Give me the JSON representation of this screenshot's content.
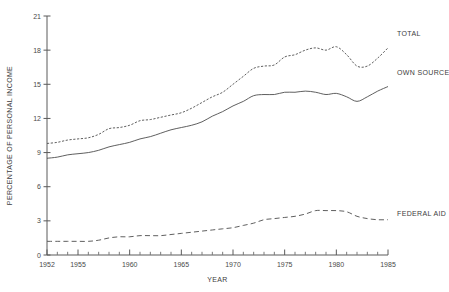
{
  "chart_data": {
    "type": "line",
    "title": "",
    "xlabel": "YEAR",
    "ylabel": "PERCENTAGE OF PERSONAL INCOME",
    "xlim": [
      1952,
      1985
    ],
    "ylim": [
      0,
      21
    ],
    "grid": false,
    "legend_position": "right-inline",
    "x_ticks_major": [
      1952,
      1955,
      1960,
      1965,
      1970,
      1975,
      1980,
      1985
    ],
    "x_ticks_minor_step": 1,
    "y_ticks": [
      0,
      3,
      6,
      9,
      12,
      15,
      18,
      21
    ],
    "x": [
      1952,
      1953,
      1954,
      1955,
      1956,
      1957,
      1958,
      1959,
      1960,
      1961,
      1962,
      1963,
      1964,
      1965,
      1966,
      1967,
      1968,
      1969,
      1970,
      1971,
      1972,
      1973,
      1974,
      1975,
      1976,
      1977,
      1978,
      1979,
      1980,
      1981,
      1982,
      1983,
      1984,
      1985
    ],
    "series": [
      {
        "name": "TOTAL",
        "style": "dotted",
        "label": "TOTAL",
        "values": [
          9.8,
          9.9,
          10.1,
          10.2,
          10.3,
          10.6,
          11.1,
          11.2,
          11.4,
          11.8,
          11.9,
          12.1,
          12.3,
          12.5,
          12.9,
          13.4,
          13.9,
          14.3,
          15.0,
          15.7,
          16.4,
          16.6,
          16.7,
          17.4,
          17.6,
          18.0,
          18.2,
          18.0,
          18.3,
          17.6,
          16.6,
          16.6,
          17.3,
          18.2
        ]
      },
      {
        "name": "OWN SOURCE",
        "style": "solid",
        "label": "OWN SOURCE",
        "values": [
          8.5,
          8.6,
          8.8,
          8.9,
          9.0,
          9.2,
          9.5,
          9.7,
          9.9,
          10.2,
          10.4,
          10.7,
          11.0,
          11.2,
          11.4,
          11.7,
          12.2,
          12.6,
          13.1,
          13.5,
          14.0,
          14.1,
          14.1,
          14.3,
          14.3,
          14.4,
          14.3,
          14.1,
          14.2,
          13.9,
          13.5,
          13.9,
          14.4,
          14.8
        ]
      },
      {
        "name": "FEDERAL AID",
        "style": "dashed",
        "label": "FEDERAL AID",
        "values": [
          1.2,
          1.2,
          1.2,
          1.2,
          1.2,
          1.3,
          1.5,
          1.6,
          1.6,
          1.7,
          1.7,
          1.7,
          1.8,
          1.9,
          2.0,
          2.1,
          2.2,
          2.3,
          2.4,
          2.6,
          2.8,
          3.1,
          3.2,
          3.3,
          3.4,
          3.6,
          3.9,
          3.9,
          3.9,
          3.8,
          3.4,
          3.2,
          3.1,
          3.1
        ]
      }
    ]
  },
  "annotations": {
    "total_label": "TOTAL",
    "own_source_label": "OWN SOURCE",
    "federal_aid_label": "FEDERAL AID"
  }
}
